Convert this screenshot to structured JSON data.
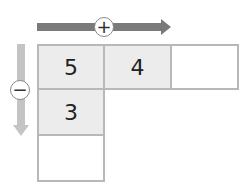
{
  "diagram": {
    "arrows": {
      "horizontal": {
        "direction": "right",
        "symbol": "+",
        "color": "#7a7a7a"
      },
      "vertical": {
        "direction": "down",
        "symbol": "−",
        "color": "#c4c4c4"
      }
    },
    "grid": {
      "row1": [
        "5",
        "4",
        ""
      ],
      "col1_row2": "3",
      "col1_row3": ""
    },
    "colors": {
      "filled_cell": "#ececec",
      "empty_cell": "#ffffff",
      "border": "#b8b8b8"
    }
  }
}
